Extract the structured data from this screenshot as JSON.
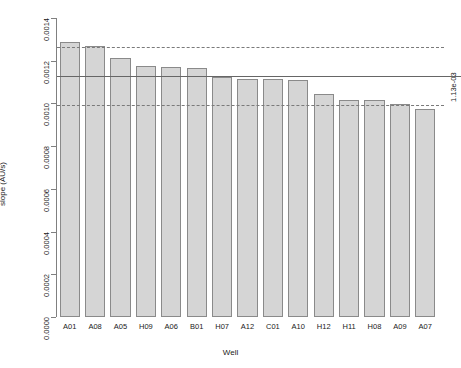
{
  "chart_data": {
    "type": "bar",
    "title": "",
    "xlabel": "Well",
    "ylabel": "slope (AU/s)",
    "categories": [
      "A01",
      "A08",
      "A05",
      "H09",
      "A06",
      "B01",
      "H07",
      "A12",
      "C01",
      "A10",
      "H12",
      "H11",
      "H08",
      "A09",
      "A07"
    ],
    "values": [
      0.001288,
      0.001268,
      0.001212,
      0.001176,
      0.001172,
      0.001166,
      0.001126,
      0.001116,
      0.001114,
      0.001112,
      0.001046,
      0.001016,
      0.001014,
      0.000996,
      0.000972
    ],
    "ylim": [
      0.0,
      0.0014
    ],
    "yticks": [
      0.0,
      0.0002,
      0.0004,
      0.0006,
      0.0008,
      0.001,
      0.0012,
      0.0014
    ],
    "ytick_labels": [
      "0.0000",
      "0.0002",
      "0.0004",
      "0.0006",
      "0.0008",
      "0.0010",
      "0.0012",
      "0.0014"
    ],
    "grid": false,
    "legend": "none",
    "bar_fill_color": "#d5d5d5",
    "bar_edge_color": "#8a8a8a",
    "reference_lines": [
      {
        "name": "upper-bound",
        "value": 0.001266,
        "style": "dashed",
        "color": "#7a7a7a"
      },
      {
        "name": "mean",
        "value": 0.00113,
        "style": "solid",
        "color": "#666666",
        "label": "1.13e-03"
      },
      {
        "name": "lower-bound",
        "value": 0.000994,
        "style": "dashed",
        "color": "#7a7a7a"
      }
    ],
    "annotations": [
      {
        "name": "mean-value-label",
        "text": "1.13e-03",
        "rotation": -90,
        "position": "right-margin"
      }
    ]
  }
}
